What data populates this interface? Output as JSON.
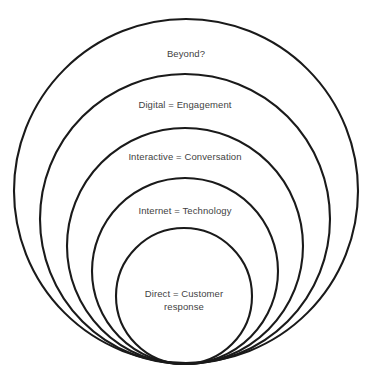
{
  "diagram": {
    "type": "nested-tangent-circles",
    "background_color": "#ffffff",
    "stroke_color": "#1a1a1a",
    "text_color": "#3f3f3f",
    "tangent_point": {
      "x": 185,
      "y": 364
    },
    "rings": [
      {
        "id": "beyond",
        "label": "Beyond?",
        "order": 1,
        "center": {
          "x": 186,
          "y": 191
        },
        "radius": 172,
        "label_position": {
          "x": 186,
          "y": 48
        }
      },
      {
        "id": "digital",
        "label": "Digital = Engagement",
        "order": 2,
        "center": {
          "x": 185,
          "y": 219
        },
        "radius": 145,
        "label_position": {
          "x": 185,
          "y": 99
        }
      },
      {
        "id": "interactive",
        "label": "Interactive = Conversation",
        "order": 3,
        "center": {
          "x": 185,
          "y": 246
        },
        "radius": 118,
        "label_position": {
          "x": 185,
          "y": 151
        }
      },
      {
        "id": "internet",
        "label": "Internet = Technology",
        "order": 4,
        "center": {
          "x": 185,
          "y": 271
        },
        "radius": 93,
        "label_position": {
          "x": 185,
          "y": 205
        }
      },
      {
        "id": "direct",
        "label": "Direct = Customer\nresponse",
        "order": 5,
        "center": {
          "x": 184,
          "y": 296
        },
        "radius": 68,
        "label_position": {
          "x": 184,
          "y": 288
        }
      }
    ]
  }
}
